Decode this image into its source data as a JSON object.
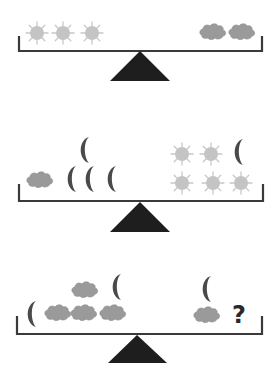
{
  "colors": {
    "sun": "#c4c4c4",
    "cloud": "#9a9a9a",
    "moon": "#4a4a4a",
    "beam": "#3a3a3a",
    "fulcrum": "#1e1e1e"
  },
  "icons": {
    "sun": "sun-icon",
    "cloud": "cloud-icon",
    "moon": "crescent-moon-icon"
  },
  "scales": [
    {
      "id": "scale-1",
      "balanced": true,
      "left": [
        {
          "type": "sun",
          "x": 37,
          "y": 33
        },
        {
          "type": "sun",
          "x": 63,
          "y": 33
        },
        {
          "type": "sun",
          "x": 92,
          "y": 33
        }
      ],
      "right": [
        {
          "type": "cloud",
          "x": 213,
          "y": 32
        },
        {
          "type": "cloud",
          "x": 242,
          "y": 32
        }
      ],
      "summary": {
        "left": "3 suns",
        "right": "2 clouds"
      }
    },
    {
      "id": "scale-2",
      "balanced": true,
      "left": [
        {
          "type": "cloud",
          "x": 40,
          "y": 180
        },
        {
          "type": "moon",
          "x": 73,
          "y": 179
        },
        {
          "type": "moon",
          "x": 91,
          "y": 179
        },
        {
          "type": "moon",
          "x": 113,
          "y": 179
        },
        {
          "type": "moon",
          "x": 86,
          "y": 150
        }
      ],
      "right": [
        {
          "type": "sun",
          "x": 182,
          "y": 154
        },
        {
          "type": "sun",
          "x": 211,
          "y": 154
        },
        {
          "type": "moon",
          "x": 240,
          "y": 152
        },
        {
          "type": "sun",
          "x": 182,
          "y": 183
        },
        {
          "type": "sun",
          "x": 213,
          "y": 183
        },
        {
          "type": "sun",
          "x": 241,
          "y": 183
        }
      ],
      "summary": {
        "left": "1 cloud + 4 moons",
        "right": "5 suns + 1 moon"
      }
    },
    {
      "id": "scale-3",
      "balanced": true,
      "left": [
        {
          "type": "moon",
          "x": 33,
          "y": 314
        },
        {
          "type": "cloud",
          "x": 58,
          "y": 313
        },
        {
          "type": "cloud",
          "x": 84,
          "y": 313
        },
        {
          "type": "cloud",
          "x": 113,
          "y": 313
        },
        {
          "type": "cloud",
          "x": 85,
          "y": 290
        },
        {
          "type": "moon",
          "x": 118,
          "y": 287
        }
      ],
      "right": [
        {
          "type": "moon",
          "x": 208,
          "y": 289
        },
        {
          "type": "cloud",
          "x": 207,
          "y": 315
        }
      ],
      "unknown_label": "?",
      "summary": {
        "left": "2 moons + 4 clouds",
        "right": "1 moon + 1 cloud + ?"
      }
    }
  ]
}
